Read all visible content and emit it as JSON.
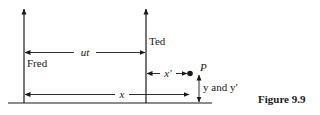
{
  "figure": {
    "caption": "Figure 9.9",
    "observers": {
      "fred": {
        "label": "Fred"
      },
      "ted": {
        "label": "Ted"
      }
    },
    "distances": {
      "ut": {
        "label": "ut"
      },
      "x": {
        "label": "x"
      },
      "x_prime": {
        "label": "x′"
      },
      "y": {
        "label": "y and y′"
      }
    },
    "point": {
      "label": "P"
    },
    "colors": {
      "ink": "#1a1a1a",
      "background": "#ffffff"
    }
  }
}
